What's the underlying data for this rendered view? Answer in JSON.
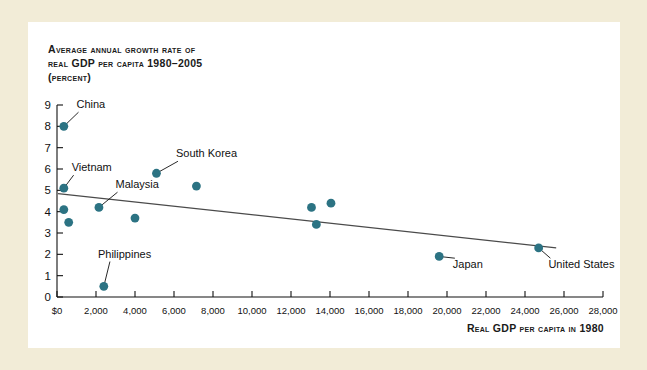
{
  "figure": {
    "title_lines": [
      "Average annual growth rate of",
      "real GDP per capita 1980–2005",
      "(percent)"
    ],
    "xaxis_title": "Real GDP per capita in 1980",
    "accent_color": "#2c7383",
    "card_background": "#ffffff",
    "page_background": "#f2ecd7"
  },
  "chart_data": {
    "type": "scatter",
    "title": "Average annual growth rate of real GDP per capita 1980–2005 (percent)",
    "xlabel": "Real GDP per capita in 1980",
    "ylabel": "Average annual growth rate of real GDP per capita 1980–2005 (percent)",
    "xlim": [
      0,
      28000
    ],
    "ylim": [
      0,
      9
    ],
    "grid": false,
    "legend": "none",
    "xticks": [
      0,
      2000,
      4000,
      6000,
      8000,
      10000,
      12000,
      14000,
      16000,
      18000,
      20000,
      22000,
      24000,
      26000,
      28000
    ],
    "xticklabels": [
      "$0",
      "2,000",
      "4,000",
      "6,000",
      "8,000",
      "10,000",
      "12,000",
      "14,000",
      "16,000",
      "18,000",
      "20,000",
      "22,000",
      "24,000",
      "26,000",
      "28,000"
    ],
    "yticks": [
      0,
      1,
      2,
      3,
      4,
      5,
      6,
      7,
      8,
      9
    ],
    "yticklabels": [
      "0",
      "1",
      "2",
      "3",
      "4",
      "5",
      "6",
      "7",
      "8",
      "9"
    ],
    "points": [
      {
        "label": "China",
        "x": 350,
        "y": 8.0
      },
      {
        "label": "Vietnam",
        "x": 350,
        "y": 5.1
      },
      {
        "label": "",
        "x": 350,
        "y": 4.1
      },
      {
        "label": "",
        "x": 600,
        "y": 3.5
      },
      {
        "label": "Malaysia",
        "x": 2150,
        "y": 4.2
      },
      {
        "label": "Philippines",
        "x": 2400,
        "y": 0.5
      },
      {
        "label": "",
        "x": 4000,
        "y": 3.7
      },
      {
        "label": "South Korea",
        "x": 5100,
        "y": 5.8
      },
      {
        "label": "",
        "x": 7150,
        "y": 5.2
      },
      {
        "label": "",
        "x": 13050,
        "y": 4.2
      },
      {
        "label": "",
        "x": 14050,
        "y": 4.4
      },
      {
        "label": "",
        "x": 13300,
        "y": 3.4
      },
      {
        "label": "Japan",
        "x": 19600,
        "y": 1.9
      },
      {
        "label": "United States",
        "x": 24700,
        "y": 2.3
      }
    ],
    "trendline": {
      "x_start": 50,
      "y_start": 4.85,
      "x_end": 25600,
      "y_end": 2.3
    },
    "annotations": [
      {
        "text": "China",
        "x": 1000,
        "y": 8.85
      },
      {
        "text": "Vietnam",
        "x": 750,
        "y": 5.9
      },
      {
        "text": "Malaysia",
        "x": 3000,
        "y": 5.1
      },
      {
        "text": "South Korea",
        "x": 6100,
        "y": 6.55
      },
      {
        "text": "Philippines",
        "x": 2100,
        "y": 1.85
      },
      {
        "text": "Japan",
        "x": 20300,
        "y": 1.35
      },
      {
        "text": "United States",
        "x": 25200,
        "y": 1.35
      }
    ]
  }
}
